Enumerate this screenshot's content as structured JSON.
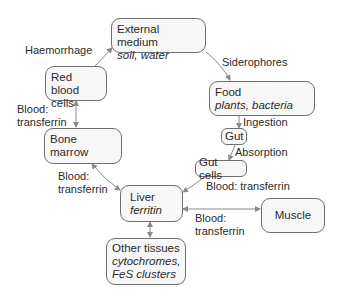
{
  "diagram": {
    "type": "flow",
    "title": "",
    "nodes": [
      {
        "id": "external",
        "title": "External medium",
        "subtitle": "soil, water"
      },
      {
        "id": "rbc",
        "title": "Red blood cells",
        "title_line1": "Red blood",
        "title_line2": "cells"
      },
      {
        "id": "food",
        "title": "Food",
        "subtitle": "plants, bacteria"
      },
      {
        "id": "gut",
        "title": "Gut"
      },
      {
        "id": "gutcells",
        "title": "Gut cells"
      },
      {
        "id": "bonemarrow",
        "title": "Bone marrow"
      },
      {
        "id": "liver",
        "title": "Liver",
        "subtitle": "ferritin"
      },
      {
        "id": "muscle",
        "title": "Muscle"
      },
      {
        "id": "other",
        "title": "Other tissues",
        "subtitle_line1": "cytochromes,",
        "subtitle_line2": "FeS clusters"
      }
    ],
    "edges": [
      {
        "from": "rbc",
        "to": "external",
        "label": "Haemorrhage"
      },
      {
        "from": "external",
        "to": "food",
        "label": "Siderophores"
      },
      {
        "from": "food",
        "to": "gut",
        "label": "Ingestion"
      },
      {
        "from": "gut",
        "to": "gutcells",
        "label": "Absorption"
      },
      {
        "from": "gutcells",
        "to": "liver",
        "label": "Blood: transferrin"
      },
      {
        "from": "rbc",
        "to": "bonemarrow",
        "label": "Blood: transferrin",
        "bidirectional": true
      },
      {
        "from": "bonemarrow",
        "to": "liver",
        "label": "Blood: transferrin",
        "bidirectional": true
      },
      {
        "from": "liver",
        "to": "muscle",
        "label": "Blood: transferrin",
        "bidirectional": true
      },
      {
        "from": "liver",
        "to": "other",
        "label": "",
        "bidirectional": true
      }
    ],
    "labels": {
      "haemorrhage": "Haemorrhage",
      "siderophores": "Siderophores",
      "ingestion": "Ingestion",
      "absorption": "Absorption",
      "gut_to_liver": "Blood: transferrin",
      "rbc_bm_line1": "Blood:",
      "rbc_bm_line2": "transferrin",
      "bm_liver_line1": "Blood:",
      "bm_liver_line2": "transferrin",
      "liver_muscle_line1": "Blood:",
      "liver_muscle_line2": "transferrin"
    },
    "colors": {
      "node_border": "#6f6f6f",
      "node_fill": "#f7f7f7",
      "arrow": "#8a8a8a",
      "text": "#2b2b2b"
    }
  }
}
